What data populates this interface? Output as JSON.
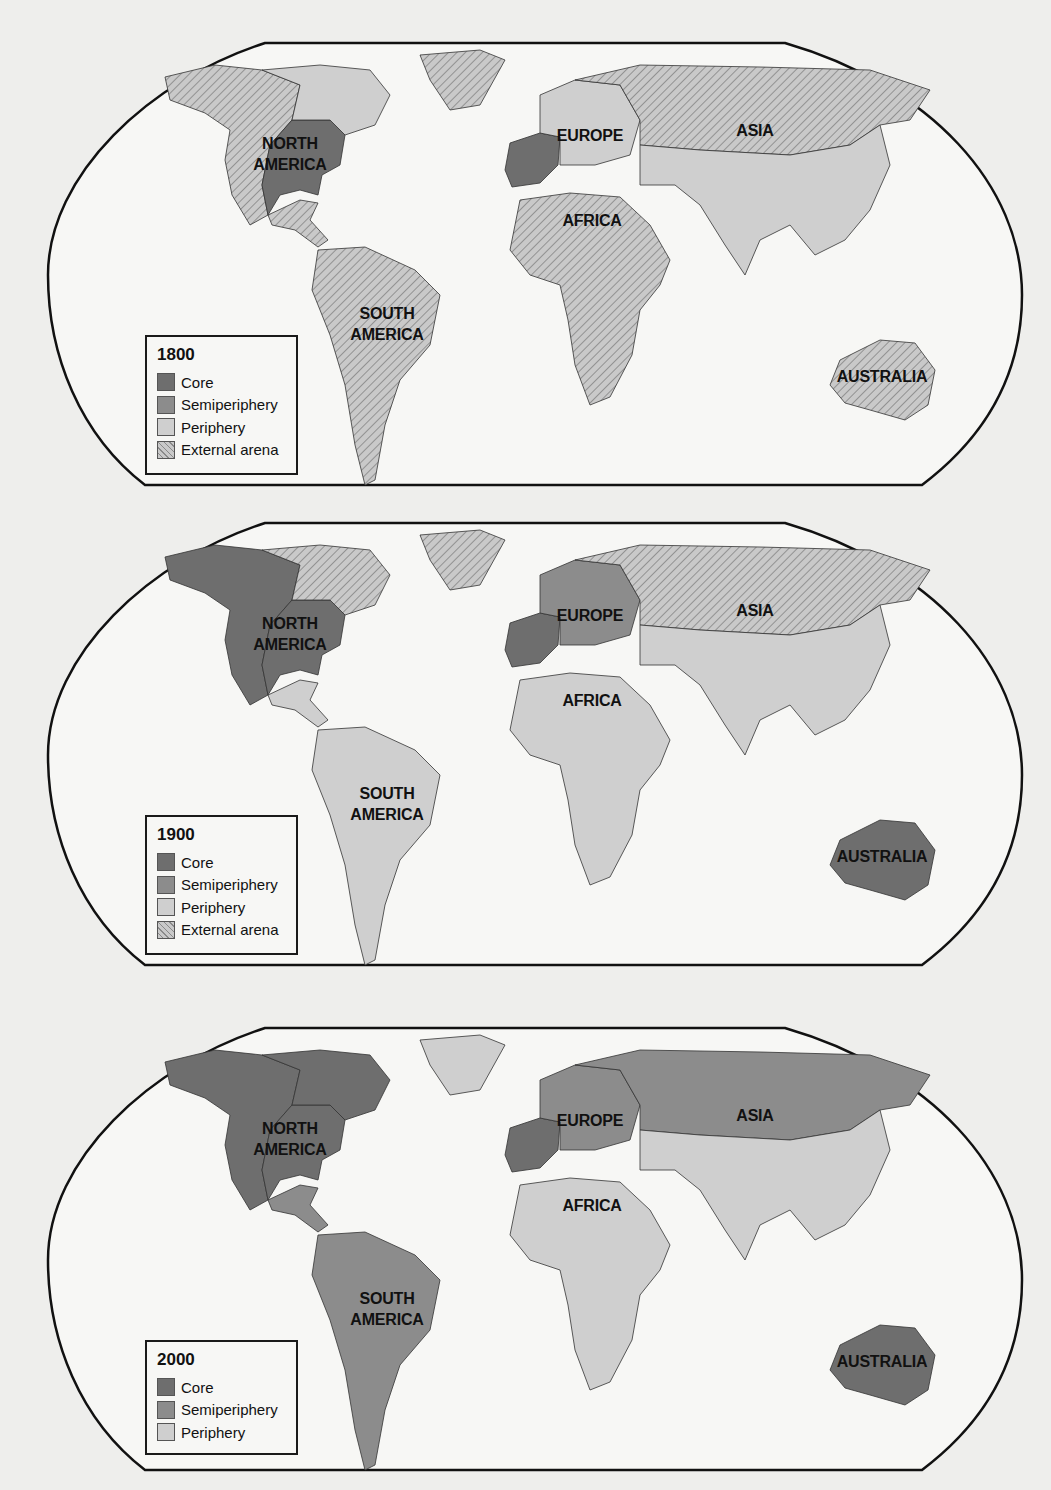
{
  "colors": {
    "core": "#6e6e6e",
    "semiperiphery": "#8c8c8c",
    "periphery": "#cfcfcf",
    "external": "#c9c9c9",
    "ocean": "#f7f7f5",
    "frame": "#111111"
  },
  "maps": [
    {
      "year": "1800",
      "labels": {
        "north_america": [
          "NORTH",
          "AMERICA"
        ],
        "south_america": [
          "SOUTH",
          "AMERICA"
        ],
        "europe": "EUROPE",
        "asia": "ASIA",
        "africa": "AFRICA",
        "australia": "AUSTRALIA"
      },
      "legend": {
        "title": "1800",
        "items": [
          {
            "label": "Core",
            "type": "core"
          },
          {
            "label": "Semiperiphery",
            "type": "semiperiphery"
          },
          {
            "label": "Periphery",
            "type": "periphery"
          },
          {
            "label": "External arena",
            "type": "external"
          }
        ]
      },
      "regions": {
        "north_america_west": "external",
        "north_america_east": "core",
        "north_america_north": "periphery",
        "greenland": "external",
        "central_america": "external",
        "south_america": "external",
        "europe_west": "core",
        "europe_east": "periphery",
        "russia": "external",
        "asia_south": "periphery",
        "africa": "external",
        "australia": "external"
      }
    },
    {
      "year": "1900",
      "labels": {
        "north_america": [
          "NORTH",
          "AMERICA"
        ],
        "south_america": [
          "SOUTH",
          "AMERICA"
        ],
        "europe": "EUROPE",
        "asia": "ASIA",
        "africa": "AFRICA",
        "australia": "AUSTRALIA"
      },
      "legend": {
        "title": "1900",
        "items": [
          {
            "label": "Core",
            "type": "core"
          },
          {
            "label": "Semiperiphery",
            "type": "semiperiphery"
          },
          {
            "label": "Periphery",
            "type": "periphery"
          },
          {
            "label": "External arena",
            "type": "external"
          }
        ]
      },
      "regions": {
        "north_america_west": "core",
        "north_america_east": "core",
        "north_america_north": "external",
        "greenland": "external",
        "central_america": "periphery",
        "south_america": "periphery",
        "europe_west": "core",
        "europe_east": "semiperiphery",
        "russia": "external",
        "asia_south": "periphery",
        "africa": "periphery",
        "australia": "core"
      }
    },
    {
      "year": "2000",
      "labels": {
        "north_america": [
          "NORTH",
          "AMERICA"
        ],
        "south_america": [
          "SOUTH",
          "AMERICA"
        ],
        "europe": "EUROPE",
        "asia": "ASIA",
        "africa": "AFRICA",
        "australia": "AUSTRALIA"
      },
      "legend": {
        "title": "2000",
        "items": [
          {
            "label": "Core",
            "type": "core"
          },
          {
            "label": "Semiperiphery",
            "type": "semiperiphery"
          },
          {
            "label": "Periphery",
            "type": "periphery"
          }
        ]
      },
      "regions": {
        "north_america_west": "core",
        "north_america_east": "core",
        "north_america_north": "core",
        "greenland": "periphery",
        "central_america": "semiperiphery",
        "south_america": "semiperiphery",
        "europe_west": "core",
        "europe_east": "semiperiphery",
        "russia": "semiperiphery",
        "asia_south": "periphery",
        "africa": "periphery",
        "australia": "core"
      }
    }
  ]
}
